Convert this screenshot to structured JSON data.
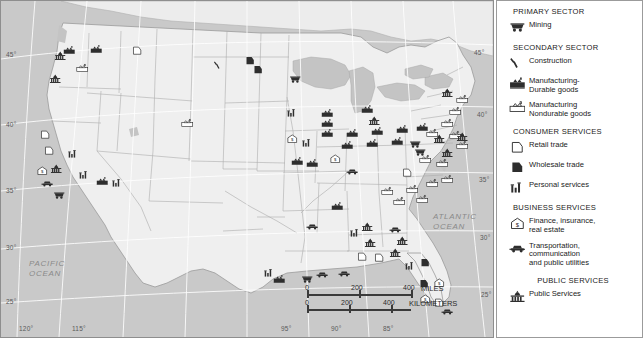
{
  "map": {
    "title": "United States Economic Activity Map",
    "ocean_labels": [
      {
        "name": "pacific-ocean-label",
        "text": "PACIFIC\nOCEAN",
        "x": 28,
        "y": 258
      },
      {
        "name": "atlantic-ocean-label",
        "text": "ATLANTIC\nOCEAN",
        "x": 432,
        "y": 211
      }
    ],
    "latitude_labels_left": [
      {
        "value": "45°",
        "y": 50
      },
      {
        "value": "40°",
        "y": 120
      },
      {
        "value": "35°",
        "y": 186
      },
      {
        "value": "30°",
        "y": 243
      },
      {
        "value": "25°",
        "y": 297
      }
    ],
    "latitude_labels_right": [
      {
        "value": "45°",
        "y": 48
      },
      {
        "value": "40°",
        "y": 110
      },
      {
        "value": "35°",
        "y": 175
      },
      {
        "value": "30°",
        "y": 233
      },
      {
        "value": "25°",
        "y": 290
      }
    ],
    "longitude_labels": [
      {
        "value": "120°",
        "x": 18
      },
      {
        "value": "115°",
        "x": 71
      },
      {
        "value": "95°",
        "x": 280
      },
      {
        "value": "90°",
        "x": 330
      },
      {
        "value": "85°",
        "x": 382
      }
    ],
    "scalebar": {
      "miles": {
        "ticks": [
          "0",
          "200",
          "400"
        ],
        "unit": "MILES"
      },
      "kilometers": {
        "ticks": [
          "0",
          "200",
          "400"
        ],
        "unit": "KILOMETERS"
      }
    }
  },
  "legend": {
    "sections": [
      {
        "name": "primary-sector",
        "heading": "PRIMARY SECTOR",
        "centered": false,
        "items": [
          {
            "icon": "mining-cart-icon",
            "label": "Mining"
          }
        ]
      },
      {
        "name": "secondary-sector",
        "heading": "SECONDARY SECTOR",
        "centered": false,
        "items": [
          {
            "icon": "construction-hammer-icon",
            "label": "Construction"
          },
          {
            "icon": "factory-dark-icon",
            "label": "Manufacturing-\nDurable goods"
          },
          {
            "icon": "factory-light-icon",
            "label": "Manufacturing\nNondurable goods"
          }
        ]
      },
      {
        "name": "consumer-services",
        "heading": "CONSUMER SERVICES",
        "centered": false,
        "items": [
          {
            "icon": "retail-outline-icon",
            "label": "Retail trade"
          },
          {
            "icon": "wholesale-filled-icon",
            "label": "Wholesale trade"
          },
          {
            "icon": "personal-services-bars-icon",
            "label": "Personal services"
          }
        ]
      },
      {
        "name": "business-services",
        "heading": "BUSINESS SERVICES",
        "centered": false,
        "items": [
          {
            "icon": "finance-house-dollar-icon",
            "label": "Finance, insurance,\nreal estate"
          },
          {
            "icon": "transportation-car-icon",
            "label": "Transportation,\ncommunication\nand public utilities"
          }
        ]
      },
      {
        "name": "public-services",
        "heading": "PUBLIC SERVICES",
        "centered": true,
        "items": [
          {
            "icon": "public-services-capitol-icon",
            "label": "Public Services"
          }
        ]
      }
    ]
  },
  "colors": {
    "ocean": "#c9c9c9",
    "land": "#efefef",
    "border": "#9b9b9b",
    "state_line": "#a9a9a9",
    "dark_symbol": "#2e2e2e",
    "light_symbol": "#ffffff",
    "text": "#1a1a1a",
    "graticule_text": "#5a5a5a",
    "ocean_text": "#8a8a8a"
  },
  "symbols": [
    {
      "type": "factory-dark",
      "x": 62,
      "y": 39
    },
    {
      "type": "factory-dark",
      "x": 89,
      "y": 38
    },
    {
      "type": "public",
      "x": 53,
      "y": 45
    },
    {
      "type": "public",
      "x": 48,
      "y": 68
    },
    {
      "type": "factory-light",
      "x": 75,
      "y": 57
    },
    {
      "type": "retail-outline",
      "x": 130,
      "y": 40
    },
    {
      "type": "construction",
      "x": 212,
      "y": 54
    },
    {
      "type": "wholesale-filled",
      "x": 243,
      "y": 50
    },
    {
      "type": "factory-light",
      "x": 180,
      "y": 112
    },
    {
      "type": "retail-outline",
      "x": 38,
      "y": 124
    },
    {
      "type": "retail-outline",
      "x": 42,
      "y": 140
    },
    {
      "type": "finance-house",
      "x": 35,
      "y": 160
    },
    {
      "type": "public",
      "x": 49,
      "y": 158
    },
    {
      "type": "personal-bars",
      "x": 66,
      "y": 143
    },
    {
      "type": "mining-cart",
      "x": 52,
      "y": 184
    },
    {
      "type": "wholesale-filled",
      "x": 251,
      "y": 59
    },
    {
      "type": "mining-cart",
      "x": 288,
      "y": 68
    },
    {
      "type": "personal-bars",
      "x": 285,
      "y": 102
    },
    {
      "type": "factory-dark",
      "x": 320,
      "y": 102
    },
    {
      "type": "factory-dark",
      "x": 320,
      "y": 112
    },
    {
      "type": "factory-dark",
      "x": 320,
      "y": 122
    },
    {
      "type": "factory-dark",
      "x": 360,
      "y": 98
    },
    {
      "type": "public",
      "x": 367,
      "y": 110
    },
    {
      "type": "finance-house",
      "x": 285,
      "y": 128
    },
    {
      "type": "personal-bars",
      "x": 300,
      "y": 132
    },
    {
      "type": "factory-dark",
      "x": 345,
      "y": 122
    },
    {
      "type": "factory-dark",
      "x": 370,
      "y": 120
    },
    {
      "type": "factory-dark",
      "x": 395,
      "y": 118
    },
    {
      "type": "factory-dark",
      "x": 415,
      "y": 116
    },
    {
      "type": "factory-light",
      "x": 440,
      "y": 112
    },
    {
      "type": "factory-light",
      "x": 448,
      "y": 100
    },
    {
      "type": "factory-light",
      "x": 455,
      "y": 88
    },
    {
      "type": "public",
      "x": 440,
      "y": 82
    },
    {
      "type": "factory-light",
      "x": 448,
      "y": 124
    },
    {
      "type": "factory-light",
      "x": 455,
      "y": 134
    },
    {
      "type": "factory-dark",
      "x": 340,
      "y": 134
    },
    {
      "type": "factory-dark",
      "x": 365,
      "y": 132
    },
    {
      "type": "factory-dark",
      "x": 390,
      "y": 130
    },
    {
      "type": "mining-cart",
      "x": 408,
      "y": 133
    },
    {
      "type": "mining-cart",
      "x": 413,
      "y": 141
    },
    {
      "type": "factory-light",
      "x": 425,
      "y": 122
    },
    {
      "type": "public",
      "x": 432,
      "y": 128
    },
    {
      "type": "public",
      "x": 440,
      "y": 142
    },
    {
      "type": "public",
      "x": 455,
      "y": 126
    },
    {
      "type": "factory-light",
      "x": 418,
      "y": 148
    },
    {
      "type": "factory-light",
      "x": 435,
      "y": 152
    },
    {
      "type": "personal-bars",
      "x": 77,
      "y": 164
    },
    {
      "type": "transportation-car",
      "x": 40,
      "y": 172
    },
    {
      "type": "factory-dark",
      "x": 95,
      "y": 170
    },
    {
      "type": "personal-bars",
      "x": 110,
      "y": 172
    },
    {
      "type": "finance-house",
      "x": 328,
      "y": 148
    },
    {
      "type": "factory-dark",
      "x": 290,
      "y": 150
    },
    {
      "type": "factory-dark",
      "x": 305,
      "y": 152
    },
    {
      "type": "transportation-car",
      "x": 345,
      "y": 160
    },
    {
      "type": "retail-outline",
      "x": 400,
      "y": 162
    },
    {
      "type": "factory-light",
      "x": 405,
      "y": 178
    },
    {
      "type": "factory-light",
      "x": 425,
      "y": 172
    },
    {
      "type": "factory-light",
      "x": 440,
      "y": 168
    },
    {
      "type": "factory-light",
      "x": 415,
      "y": 188
    },
    {
      "type": "factory-light",
      "x": 380,
      "y": 180
    },
    {
      "type": "factory-light",
      "x": 392,
      "y": 190
    },
    {
      "type": "factory-dark",
      "x": 330,
      "y": 195
    },
    {
      "type": "transportation-car",
      "x": 305,
      "y": 215
    },
    {
      "type": "personal-bars",
      "x": 348,
      "y": 222
    },
    {
      "type": "public",
      "x": 360,
      "y": 216
    },
    {
      "type": "public",
      "x": 363,
      "y": 232
    },
    {
      "type": "transportation-car",
      "x": 388,
      "y": 218
    },
    {
      "type": "public",
      "x": 395,
      "y": 230
    },
    {
      "type": "retail-outline",
      "x": 355,
      "y": 246
    },
    {
      "type": "retail-outline",
      "x": 372,
      "y": 247
    },
    {
      "type": "public",
      "x": 388,
      "y": 242
    },
    {
      "type": "personal-bars",
      "x": 403,
      "y": 255
    },
    {
      "type": "wholesale-filled",
      "x": 418,
      "y": 252
    },
    {
      "type": "transportation-car",
      "x": 315,
      "y": 263
    },
    {
      "type": "transportation-car",
      "x": 337,
      "y": 262
    },
    {
      "type": "mining-cart",
      "x": 300,
      "y": 268
    },
    {
      "type": "personal-bars",
      "x": 262,
      "y": 262
    },
    {
      "type": "factory-dark",
      "x": 272,
      "y": 268
    },
    {
      "type": "wholesale-filled",
      "x": 417,
      "y": 273
    },
    {
      "type": "finance-house",
      "x": 432,
      "y": 272
    },
    {
      "type": "finance-house",
      "x": 418,
      "y": 288
    },
    {
      "type": "retail-outline",
      "x": 432,
      "y": 292
    },
    {
      "type": "transportation-car",
      "x": 440,
      "y": 300
    }
  ]
}
